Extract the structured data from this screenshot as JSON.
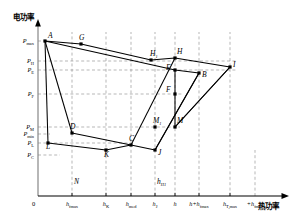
{
  "figure": {
    "kind": "cogeneration-feasible-region-diagram",
    "y_axis_title": "电功率",
    "x_axis_title": "热功率",
    "origin_label": "0"
  },
  "chart_data": {
    "type": "scatter",
    "title": "",
    "xlabel": "热功率",
    "ylabel": "电功率",
    "xlim": [
      0,
      300
    ],
    "ylim": [
      0,
      200
    ],
    "grid": "dashed-guides",
    "legend": "none",
    "x_tick_labels": [
      {
        "id": "origin",
        "text": "0",
        "x_px": 38
      },
      {
        "id": "h_fmax",
        "base": "h",
        "sub": "fmax",
        "x_px": 72
      },
      {
        "id": "h_K",
        "base": "h",
        "sub": "K",
        "x_px": 106
      },
      {
        "id": "h_med",
        "base": "h",
        "sub": "med",
        "x_px": 131
      },
      {
        "id": "h_J",
        "base": "h",
        "sub": "J",
        "x_px": 155
      },
      {
        "id": "h",
        "base": "h",
        "sub": "",
        "x_px": 175
      },
      {
        "id": "h_plus_hfmax",
        "base": "h+h",
        "sub": "fmax",
        "x_px": 199
      },
      {
        "id": "hTmax",
        "base": "h",
        "sub": "T,max",
        "x_px": 230
      },
      {
        "id": "plus_hfmax",
        "base": "+h",
        "sub": "fmax",
        "x_px": 255
      }
    ],
    "y_tick_labels": [
      {
        "id": "Pmax",
        "base": "P",
        "sub": "max",
        "y_px": 41
      },
      {
        "id": "PH",
        "base": "P",
        "sub": "H",
        "y_px": 61
      },
      {
        "id": "PE",
        "base": "P",
        "sub": "E",
        "y_px": 70
      },
      {
        "id": "PF",
        "base": "P",
        "sub": "F",
        "y_px": 94
      },
      {
        "id": "PM",
        "base": "P",
        "sub": "M",
        "y_px": 127
      },
      {
        "id": "Pmin",
        "base": "P",
        "sub": "min",
        "y_px": 134
      },
      {
        "id": "PL",
        "base": "P",
        "sub": "L",
        "y_px": 143
      },
      {
        "id": "PC",
        "base": "P",
        "sub": "C",
        "y_px": 155
      }
    ],
    "vertices": [
      {
        "name": "A",
        "x_px": 45,
        "y_px": 41,
        "label_dx": 3,
        "label_dy": -3
      },
      {
        "name": "G",
        "x_px": 81,
        "y_px": 44,
        "label_dx": -2,
        "label_dy": -4
      },
      {
        "name": "H1",
        "base": "H",
        "sub": "1",
        "x_px": 151,
        "y_px": 60,
        "label_dx": -1,
        "label_dy": -4
      },
      {
        "name": "H",
        "x_px": 175,
        "y_px": 58,
        "label_dx": 2,
        "label_dy": -4
      },
      {
        "name": "E",
        "x_px": 175,
        "y_px": 70,
        "label_dx": -9,
        "label_dy": 0
      },
      {
        "name": "B",
        "x_px": 199,
        "y_px": 73,
        "label_dx": 3,
        "label_dy": 4
      },
      {
        "name": "I",
        "x_px": 230,
        "y_px": 67,
        "label_dx": 3,
        "label_dy": 0
      },
      {
        "name": "F",
        "x_px": 175,
        "y_px": 94,
        "label_dx": -9,
        "label_dy": -2
      },
      {
        "name": "M1",
        "base": "M",
        "sub": "1",
        "x_px": 155,
        "y_px": 127,
        "label_dx": -2,
        "label_dy": -4
      },
      {
        "name": "M",
        "x_px": 175,
        "y_px": 127,
        "label_dx": 2,
        "label_dy": -4
      },
      {
        "name": "D",
        "x_px": 72,
        "y_px": 133,
        "label_dx": -2,
        "label_dy": -4
      },
      {
        "name": "C",
        "x_px": 131,
        "y_px": 145,
        "label_dx": -2,
        "label_dy": -4
      },
      {
        "name": "L",
        "x_px": 48,
        "y_px": 143,
        "label_dx": -2,
        "label_dy": 6
      },
      {
        "name": "K",
        "x_px": 106,
        "y_px": 150,
        "label_dx": -2,
        "label_dy": 7
      },
      {
        "name": "J",
        "x_px": 155,
        "y_px": 150,
        "label_dx": 3,
        "label_dy": 5
      },
      {
        "name": "N",
        "x_px": 72,
        "y_px": 186,
        "label_dx": 2,
        "label_dy": -2
      },
      {
        "name": "hH1",
        "base": "h",
        "sub": "H1",
        "x_px": 155,
        "y_px": 186,
        "label_dx": 2,
        "label_dy": -2
      }
    ],
    "upper_boundary": [
      "A",
      "G",
      "H1",
      "H",
      "I"
    ],
    "second_upper_line": [
      "A",
      "E",
      "B"
    ],
    "lower_boundary": [
      "L",
      "K",
      "C",
      "J"
    ],
    "upper_lower_link": [
      "D",
      "C"
    ],
    "slanted_lines": [
      {
        "from": "J",
        "to": "B"
      },
      {
        "from": "C",
        "to": "H"
      },
      {
        "from": "M",
        "to": "I"
      }
    ],
    "colors": {
      "curve": "#000000",
      "guide": "#9a9a9a",
      "axis": "#000000"
    }
  }
}
